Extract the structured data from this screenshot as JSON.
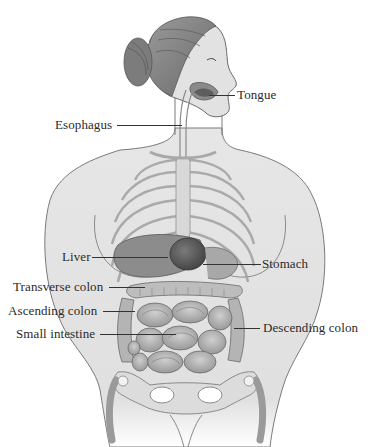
{
  "diagram": {
    "colors": {
      "skin": "#e4e4e4",
      "outline": "#6e6e6e",
      "hair": "#8a8a8a",
      "organ_dark": "#5a5a5a",
      "intestine": "#b8b8b8",
      "label_text": "#2a2a2a"
    },
    "labels": [
      {
        "id": "tongue",
        "text": "Tongue"
      },
      {
        "id": "esophagus",
        "text": "Esophagus"
      },
      {
        "id": "liver",
        "text": "Liver"
      },
      {
        "id": "stomach",
        "text": "Stomach"
      },
      {
        "id": "transverse_colon",
        "text": "Transverse colon"
      },
      {
        "id": "ascending_colon",
        "text": "Ascending colon"
      },
      {
        "id": "small_intestine",
        "text": "Small intestine"
      },
      {
        "id": "descending_colon",
        "text": "Descending colon"
      }
    ]
  }
}
